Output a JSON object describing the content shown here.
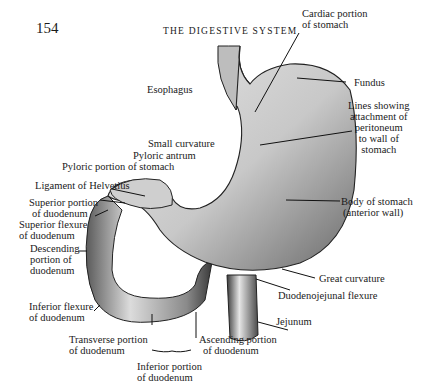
{
  "page": {
    "number": "154",
    "running_head": "THE DIGESTIVE SYSTEM"
  },
  "figure": {
    "labels": {
      "cardiac_1": "Cardiac portion",
      "cardiac_2": "of stomach",
      "fundus": "Fundus",
      "lines_1": "Lines showing",
      "lines_2": "attachment of",
      "lines_3": "peritoneum",
      "lines_4": "to wall of",
      "lines_5": "stomach",
      "esophagus": "Esophagus",
      "small_curvature": "Small curvature",
      "pyloric_antrum": "Pyloric antrum",
      "pyloric_portion": "Pyloric portion of stomach",
      "ligament": "Ligament of Helvetius",
      "sup_portion_1": "Superior portion",
      "sup_portion_2": "of duodenum",
      "sup_flexure_1": "Superior flexure",
      "sup_flexure_2": "of duodenum",
      "desc_1": "Descending",
      "desc_2": "portion of",
      "desc_3": "duodenum",
      "body_1": "Body of stomach",
      "body_2": "(anterior wall)",
      "great_curvature": "Great curvature",
      "dj_flexure": "Duodenojejunal flexure",
      "jejunum": "Jejunum",
      "inf_flexure_1": "Inferior flexure",
      "inf_flexure_2": "of duodenum",
      "transverse_1": "Transverse portion",
      "transverse_2": "of duodenum",
      "ascending_1": "Ascending portion",
      "ascending_2": "of duodenum",
      "inferior_1": "Inferior portion",
      "inferior_2": "of duodenum"
    }
  }
}
